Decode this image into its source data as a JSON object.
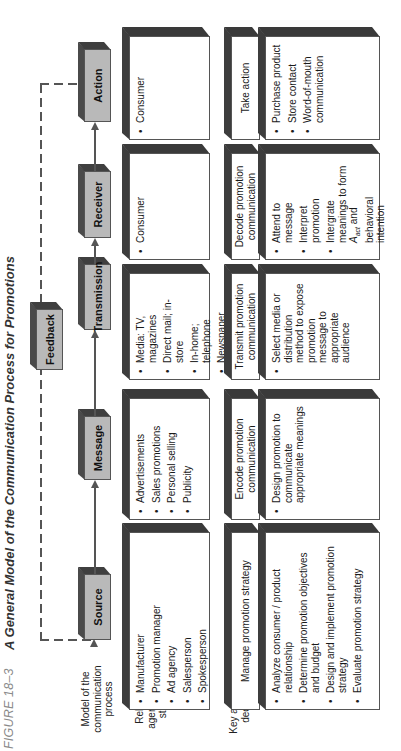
{
  "figure": {
    "label": "FIGURE 18–3",
    "title": "A General Model of the Communication Process for Promotions"
  },
  "row_labels": {
    "model": "Model of the communication process",
    "agents": "Relevant agents and stimuli",
    "actions": "Key actions or decisions"
  },
  "process": {
    "source": "Source",
    "message": "Message",
    "transmission": "Transmission",
    "receiver": "Receiver",
    "action": "Action",
    "feedback": "Feedback"
  },
  "agents": {
    "source": [
      "Manufacturer",
      "Promotion manager",
      "Ad agency",
      "Salesperson",
      "Spokesperson"
    ],
    "message": [
      "Advertisements",
      "Sales promotions",
      "Personal selling",
      "Publicity"
    ],
    "transmission": [
      "Media: TV, magazines",
      "Direct mail; in-store",
      "In-home; telephone",
      "Newspaper articles"
    ],
    "receiver": [
      "Consumer"
    ],
    "action": [
      "Consumer"
    ]
  },
  "key_actions": {
    "source": {
      "header": "Manage promotion strategy",
      "items": [
        "Analyze consumer / product relationship",
        "Determine promotion objectives and budget",
        "Design and implement promotion strategy",
        "Evaluate promotion strategy"
      ]
    },
    "message": {
      "header": "Encode promotion communication",
      "items": [
        "Design promotion to communicate appropriate meanings"
      ]
    },
    "transmission": {
      "header": "Transmit promotion communication",
      "items": [
        "Select media or distribution method to expose promotion message to appropriate audience"
      ]
    },
    "receiver": {
      "header": "Decode promotion communication",
      "items": [
        "Attend to message",
        "Interpret promotion",
        "Intergrate meanings to form"
      ],
      "item3_symbol": "A",
      "item3_subscript": "act",
      "item3_tail": "and behavioral intention"
    },
    "action": {
      "header": "Take action",
      "items": [
        "Purchase product",
        "Store contact",
        "Word-of-mouth communication"
      ]
    }
  },
  "colors": {
    "process_box_fill": "#b9b9b9",
    "box_shadow": "#3d3d3d",
    "line": "#555555",
    "caption_gray": "#8a8a8a"
  }
}
